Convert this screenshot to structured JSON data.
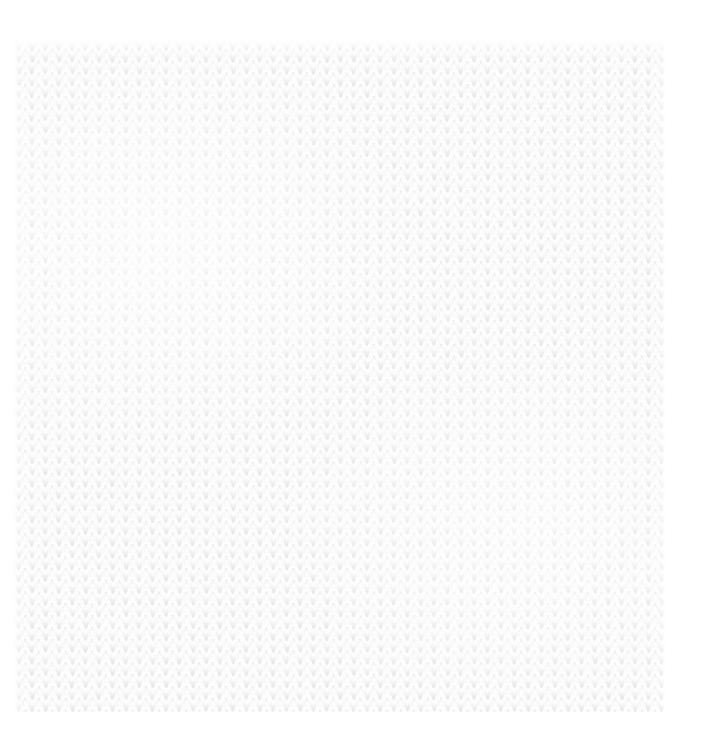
{
  "image": {
    "kind": "texture-photograph",
    "subject": "knitted fabric",
    "stitch_pattern": "stockinette",
    "description": "Close-up of a plain white knitted wool fabric showing rows of V-shaped stockinette stitches",
    "alt_text": "White knitted stockinette fabric texture",
    "has_text": false,
    "has_ui_controls": false
  },
  "canvas": {
    "width": 707,
    "height": 749,
    "page_background": "#ffffff"
  },
  "swatch": {
    "left": 12,
    "top": 38,
    "width": 653,
    "height": 674,
    "background": "#fdfdfd"
  },
  "stitch_grid": {
    "cell_width": 13.4,
    "cell_height": 11.8,
    "columns": 50,
    "rows": 58,
    "row_offset": 0,
    "aligned_columns": true
  },
  "palette": {
    "fabric_base": "#fdfdfd",
    "stitch_shadow": "#ededee",
    "stitch_midtone": "#f4f4f5",
    "stitch_highlight": "#ffffff",
    "page_white": "#ffffff"
  },
  "rendering": {
    "blur_px": 0.65,
    "stroke_width": 2.1,
    "leg_stroke_width": 2.6
  }
}
